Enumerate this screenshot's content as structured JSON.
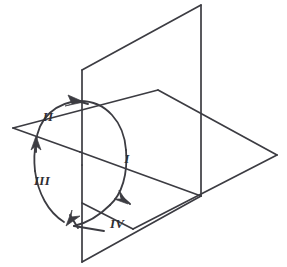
{
  "figure": {
    "type": "isometric-line-diagram",
    "background_color": "#ffffff",
    "line_color": "#3c3c42",
    "label_color": "#2e2e33"
  },
  "labels": {
    "quadrant_1": "I",
    "quadrant_2": "II",
    "quadrant_3": "III",
    "quadrant_4": "IV"
  },
  "label_positions": {
    "quadrant_1": {
      "x": 127,
      "y": 160
    },
    "quadrant_2": {
      "x": 48,
      "y": 118
    },
    "quadrant_3": {
      "x": 42,
      "y": 182
    },
    "quadrant_4": {
      "x": 117,
      "y": 225
    }
  },
  "geometry": {
    "vertical_plane": {
      "name": "vertical-plane",
      "vertices": [
        {
          "x": 82,
          "y": 70
        },
        {
          "x": 201,
          "y": 5
        },
        {
          "x": 201,
          "y": 196
        },
        {
          "x": 82,
          "y": 262
        }
      ]
    },
    "horizontal_plane": {
      "name": "horizontal-plane",
      "vertices": [
        {
          "x": 13,
          "y": 128
        },
        {
          "x": 158,
          "y": 90
        },
        {
          "x": 277,
          "y": 155
        },
        {
          "x": 133,
          "y": 229
        }
      ]
    },
    "intersection_axis": {
      "name": "plane-intersection-line",
      "from": {
        "x": 13,
        "y": 128
      },
      "to": {
        "x": 201,
        "y": 196
      }
    },
    "orbit_ellipse": {
      "name": "orbit-circle",
      "center": {
        "x": 80,
        "y": 165
      },
      "rx": 46,
      "ry": 64,
      "rotation_deg": -18
    }
  },
  "annotations": {
    "arrow_count": 4,
    "direction": "clockwise",
    "tick_count": 4
  }
}
